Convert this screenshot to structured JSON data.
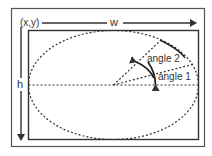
{
  "diagram": {
    "labels": {
      "origin": "(x,y)",
      "width": "w",
      "height": "h",
      "angle1": "angle 1",
      "angle2": "angle 2"
    },
    "colors": {
      "stroke": "#333333",
      "background": "#ffffff"
    }
  }
}
